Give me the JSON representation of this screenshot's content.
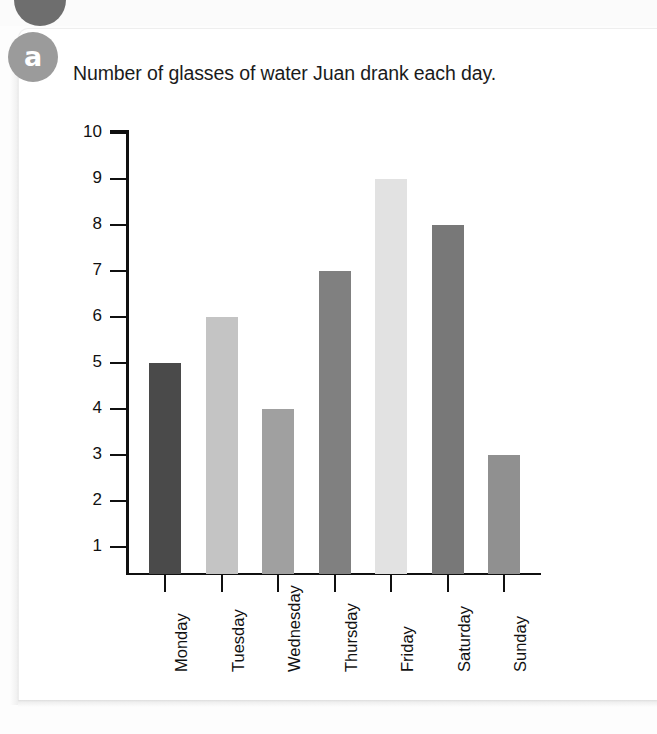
{
  "badge": {
    "letter": "a",
    "color": "#9b9b9b",
    "previous_badge_color": "#6e6e6e"
  },
  "chart_data": {
    "type": "bar",
    "title": "Number of glasses of water Juan drank each day.",
    "xlabel": "",
    "ylabel": "",
    "categories": [
      "Monday",
      "Tuesday",
      "Wednesday",
      "Thursday",
      "Friday",
      "Saturday",
      "Sunday"
    ],
    "values": [
      5,
      6,
      4,
      7,
      9,
      8,
      3
    ],
    "bar_colors": [
      "#4a4a4a",
      "#c4c4c4",
      "#a0a0a0",
      "#808080",
      "#e2e2e2",
      "#787878",
      "#909090"
    ],
    "ylim": [
      1,
      10
    ],
    "yticks": [
      1,
      2,
      3,
      4,
      5,
      6,
      7,
      8,
      9,
      10
    ],
    "ytick_labels": [
      "1",
      "2",
      "3",
      "4",
      "5",
      "6",
      "7",
      "8",
      "9",
      "10"
    ],
    "grid": false,
    "legend": false,
    "axis_color": "#101010"
  }
}
